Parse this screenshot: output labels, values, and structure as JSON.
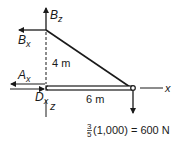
{
  "diagram": {
    "type": "free-body diagram",
    "colors": {
      "ink": "#1a1a1a",
      "background": "#ffffff"
    },
    "forces": {
      "bz": {
        "symbol": "B",
        "subscript": "z",
        "direction": "up"
      },
      "bx": {
        "symbol": "B",
        "subscript": "x",
        "direction": "left"
      },
      "ax": {
        "symbol": "A",
        "subscript": "x",
        "direction": "left"
      },
      "dx": {
        "symbol": "D",
        "subscript": "x",
        "direction": "right"
      },
      "load": {
        "direction": "down"
      }
    },
    "dimensions": {
      "vertical": "4 m",
      "horizontal": "6 m"
    },
    "axes": {
      "x": "x",
      "z": "z"
    },
    "load_label": {
      "fraction_num": "3",
      "fraction_den": "5",
      "expression": "(1,000) = 600 N"
    }
  }
}
